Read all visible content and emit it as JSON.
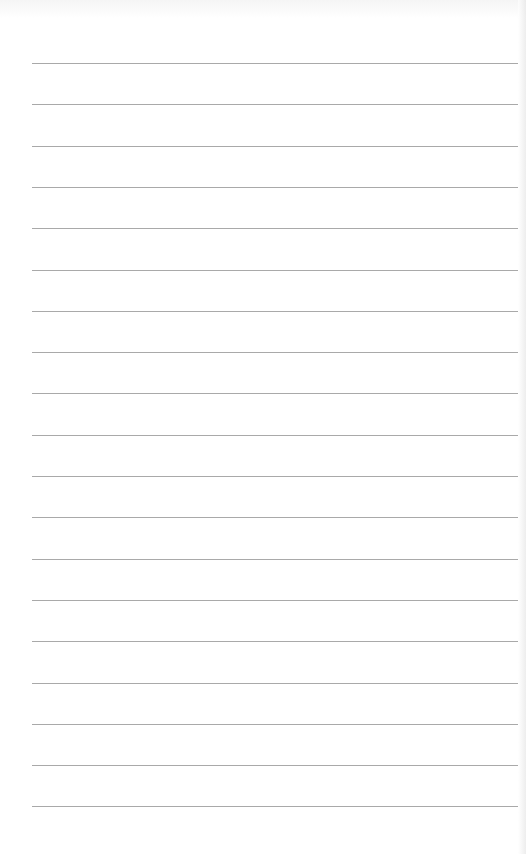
{
  "paper": {
    "type": "lined-paper",
    "background_color": "#ffffff",
    "line_color": "#a9a9a9",
    "line_count": 19,
    "first_line_y": 63,
    "line_spacing": 41.3,
    "line_left": 32,
    "line_right": 518
  }
}
